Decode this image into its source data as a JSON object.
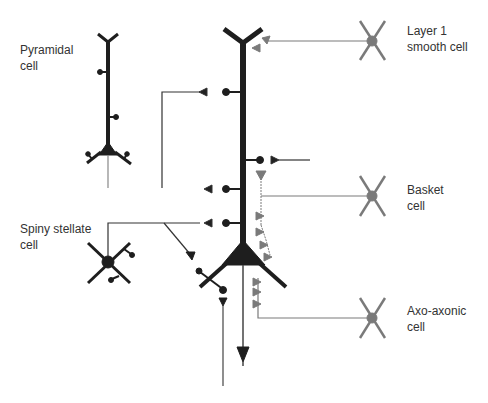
{
  "labels": {
    "pyramidal": "Pyramidal\ncell",
    "layer1": "Layer 1\nsmooth cell",
    "basket": "Basket\ncell",
    "spiny_stellate": "Spiny stellate\ncell",
    "axo_axonic": "Axo-axonic\ncell"
  },
  "colors": {
    "excitatory": "#1e1e1e",
    "inhibitory": "#7a7a7a",
    "axon_line": "#444444"
  }
}
